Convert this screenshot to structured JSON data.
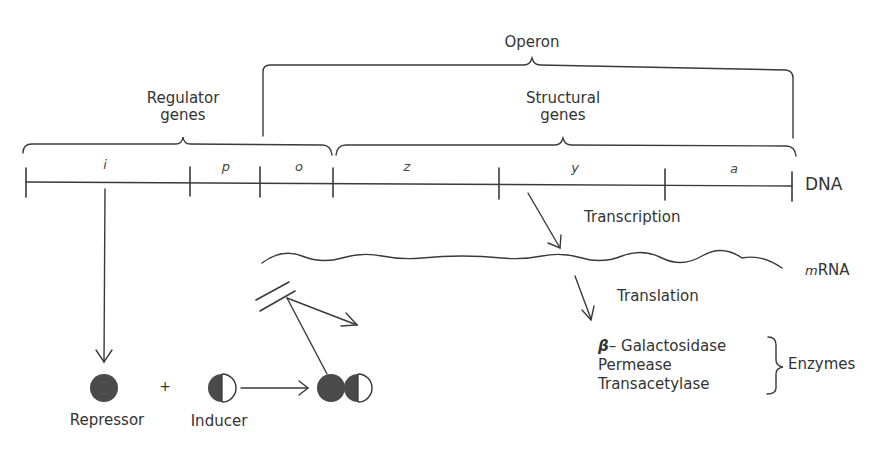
{
  "labels": {
    "operon": "Operon",
    "regulator_genes_line1": "Regulator",
    "regulator_genes_line2": "genes",
    "structural_genes_line1": "Structural",
    "structural_genes_line2": "genes",
    "dna": "DNA",
    "mrna_prefix": "m",
    "mrna_suffix": "RNA",
    "transcription": "Transcription",
    "translation": "Translation",
    "repressor": "Repressor",
    "inducer": "Inducer",
    "plus": "+",
    "enzymes": "Enzymes"
  },
  "genes": [
    {
      "id": "i",
      "label": "i"
    },
    {
      "id": "p",
      "label": "p"
    },
    {
      "id": "o",
      "label": "o"
    },
    {
      "id": "z",
      "label": "z"
    },
    {
      "id": "y",
      "label": "y"
    },
    {
      "id": "a",
      "label": "a"
    }
  ],
  "enzymes": [
    {
      "prefix": "β",
      "name": "– Galactosidase"
    },
    {
      "prefix": "",
      "name": "Permease"
    },
    {
      "prefix": "",
      "name": "Transacetylase"
    }
  ],
  "colors": {
    "line": "#3a3a3a",
    "fill": "#4a4a4a",
    "text": "#333333"
  }
}
